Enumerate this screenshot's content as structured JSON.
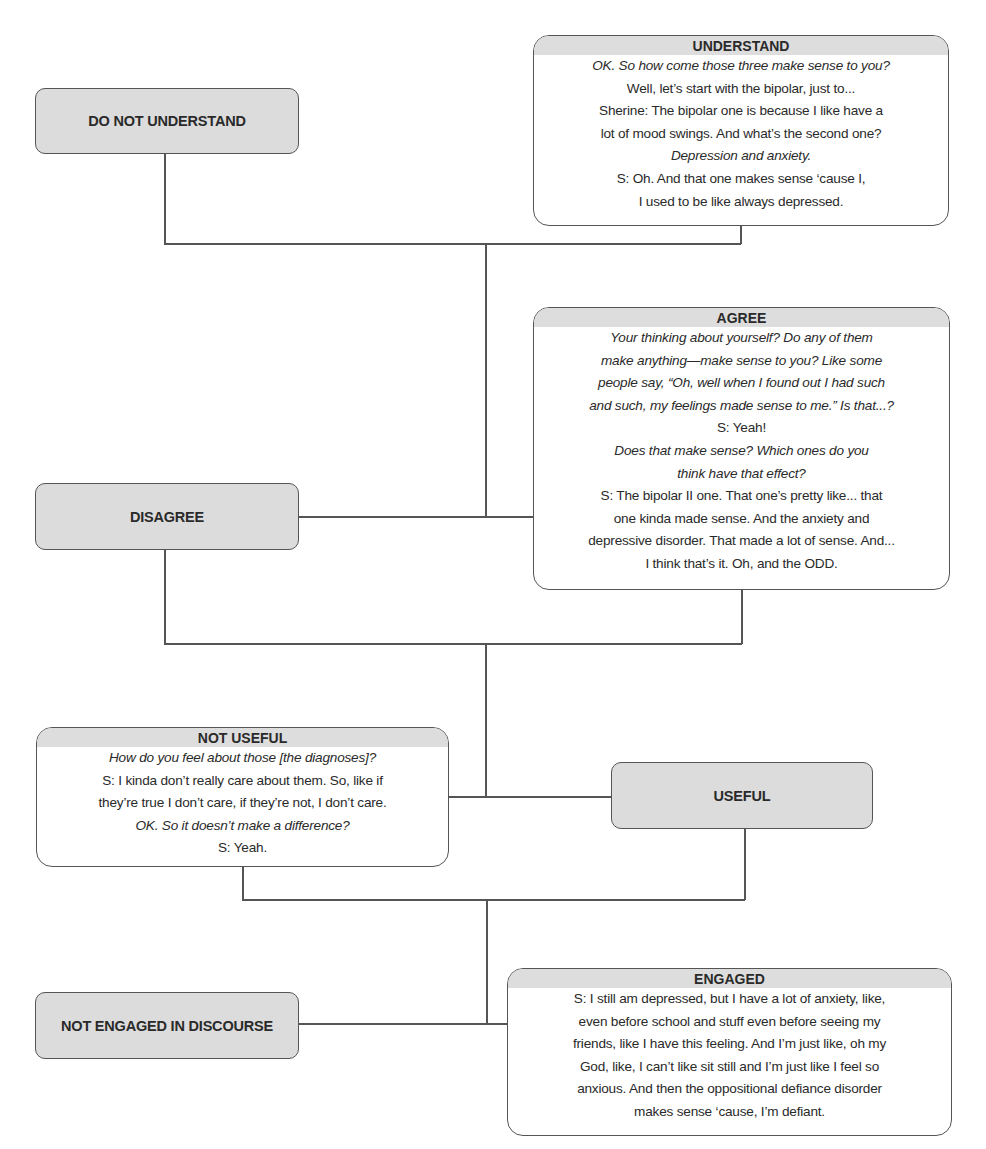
{
  "diagram": {
    "nodes": {
      "do_not_understand": {
        "label": "DO NOT UNDERSTAND"
      },
      "understand": {
        "label": "UNDERSTAND",
        "lines": [
          {
            "text": "OK. So how come those three make sense to you?",
            "italic": true
          },
          {
            "text": "Well, let’s start with the bipolar, just to...",
            "italic": false
          },
          {
            "text": "Sherine: The bipolar one is because I like have a",
            "italic": false
          },
          {
            "text": "lot of mood swings. And what’s the second one?",
            "italic": false
          },
          {
            "text": "Depression and anxiety.",
            "italic": true
          },
          {
            "text": "S: Oh. And that one makes sense ‘cause I,",
            "italic": false
          },
          {
            "text": "I used to be like always depressed.",
            "italic": false
          }
        ]
      },
      "disagree": {
        "label": "DISAGREE"
      },
      "agree": {
        "label": "AGREE",
        "lines": [
          {
            "text": "Your thinking about yourself? Do any of them",
            "italic": true
          },
          {
            "text": "make anything—make sense to you? Like some",
            "italic": true
          },
          {
            "text": "people say, “Oh, well when I found out I had such",
            "italic": true
          },
          {
            "text": "and such, my feelings made sense to me.” Is that...?",
            "italic": true
          },
          {
            "text": "S: Yeah!",
            "italic": false
          },
          {
            "text": "Does that make sense? Which ones do you",
            "italic": true
          },
          {
            "text": "think have that effect?",
            "italic": true
          },
          {
            "text": "S: The bipolar II one. That one’s pretty like... that",
            "italic": false
          },
          {
            "text": "one kinda made sense. And the anxiety and",
            "italic": false
          },
          {
            "text": "depressive disorder. That made a lot of sense. And...",
            "italic": false
          },
          {
            "text": "I think that’s it. Oh, and the ODD.",
            "italic": false
          }
        ]
      },
      "not_useful": {
        "label": "NOT USEFUL",
        "lines": [
          {
            "text": "How do you feel about those [the diagnoses]?",
            "italic": true
          },
          {
            "text": "S: I kinda don’t really care about them. So, like if",
            "italic": false
          },
          {
            "text": "they’re true I don’t care, if they’re not, I don’t care.",
            "italic": false
          },
          {
            "text": "OK. So it doesn’t make a difference?",
            "italic": true
          },
          {
            "text": "S: Yeah.",
            "italic": false
          }
        ]
      },
      "useful": {
        "label": "USEFUL"
      },
      "not_engaged": {
        "label": "NOT ENGAGED IN DISCOURSE"
      },
      "engaged": {
        "label": "ENGAGED",
        "lines": [
          {
            "text": "S: I still am depressed, but I have a lot of anxiety, like,",
            "italic": false
          },
          {
            "text": "even before school and stuff even before seeing my",
            "italic": false
          },
          {
            "text": "friends,  like I have this feeling. And I’m just like, oh my",
            "italic": false
          },
          {
            "text": "God, like, I can’t like sit still and I’m just like I feel so",
            "italic": false
          },
          {
            "text": "anxious. And then the oppositional defiance disorder",
            "italic": false
          },
          {
            "text": "makes sense ‘cause, I’m defiant.",
            "italic": false
          }
        ]
      }
    },
    "colors": {
      "box_fill": "#dcdcdc",
      "border": "#555555",
      "background": "#ffffff"
    }
  }
}
